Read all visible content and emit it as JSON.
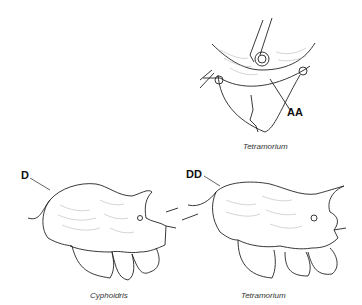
{
  "figure": {
    "panels": [
      {
        "id": "top-right",
        "label": "AA",
        "caption": "Tetramorium"
      },
      {
        "id": "bottom-left",
        "label": "D",
        "caption": "Cyphoidris"
      },
      {
        "id": "bottom-right",
        "label": "DD",
        "caption": "Tetramorium"
      }
    ],
    "colors": {
      "line": "#222222",
      "texture": "#999999",
      "background": "#ffffff"
    }
  }
}
